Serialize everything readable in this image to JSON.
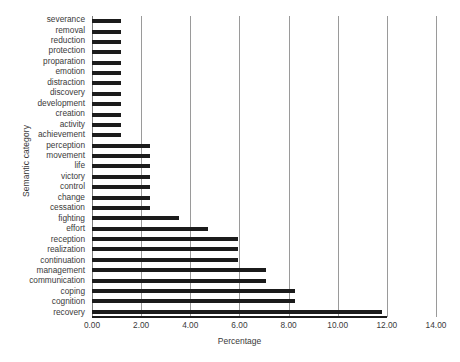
{
  "chart_data": {
    "type": "bar",
    "orientation": "horizontal",
    "title": "",
    "xlabel": "Percentage",
    "ylabel": "Semantic category",
    "xlim": [
      0,
      14
    ],
    "ylim": null,
    "grid": true,
    "gridlines_x": [
      0,
      2,
      4,
      6,
      8,
      10,
      12,
      14
    ],
    "xticks": [
      0,
      2,
      4,
      6,
      8,
      10,
      12,
      14
    ],
    "xticklabels": [
      "0.00",
      "2.00",
      "4.00",
      "6.00",
      "8.00",
      "10.00",
      "12.00",
      "14.00"
    ],
    "legend": null,
    "bar_color": "#1b1b1b",
    "categories": [
      "severance",
      "removal",
      "reduction",
      "protection",
      "proparation",
      "emotion",
      "distraction",
      "discovery",
      "development",
      "creation",
      "activity",
      "achievement",
      "perception",
      "movement",
      "life",
      "victory",
      "control",
      "change",
      "cessation",
      "fighting",
      "effort",
      "reception",
      "realization",
      "continuation",
      "management",
      "communication",
      "coping",
      "cognition",
      "recovery"
    ],
    "values": [
      1.18,
      1.18,
      1.18,
      1.18,
      1.18,
      1.18,
      1.18,
      1.18,
      1.18,
      1.18,
      1.18,
      1.18,
      2.35,
      2.35,
      2.35,
      2.35,
      2.35,
      2.35,
      2.35,
      3.53,
      4.71,
      5.95,
      5.95,
      5.95,
      7.1,
      7.1,
      8.25,
      8.25,
      11.8
    ]
  }
}
